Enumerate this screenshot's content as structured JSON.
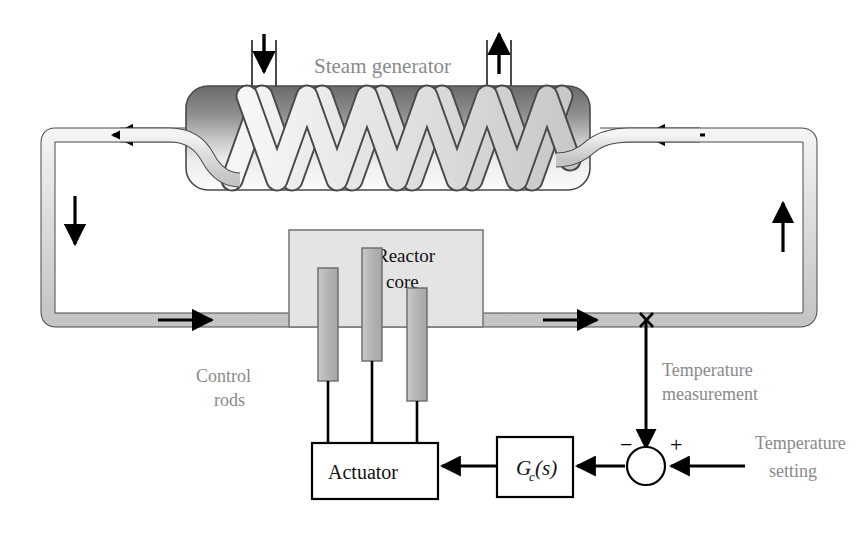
{
  "diagram": {
    "labels": {
      "steam_generator": "Steam generator",
      "reactor_core_line1": "Reactor",
      "reactor_core_line2": "core",
      "control_rods_line1": "Control",
      "control_rods_line2": "rods",
      "temperature_measurement_line1": "Temperature",
      "temperature_measurement_line2": "measurement",
      "temperature_setting_line1": "Temperature",
      "temperature_setting_line2": "setting",
      "actuator": "Actuator",
      "controller_g": "G",
      "controller_sub": "c",
      "controller_arg": "(s)",
      "sign_negative": "−",
      "sign_positive": "+"
    },
    "colors": {
      "label_gray": "#8a8a8a",
      "text_black": "#111111",
      "pipe_fill": "#d6d6d6",
      "pipe_stroke": "#4a4a4a",
      "vessel_dark": "#6e6e6e",
      "vessel_light": "#f2f2f2",
      "coil_fill": "#dcdcdc",
      "core_fill": "#e4e4e4",
      "core_stroke": "#7a7a7a",
      "rod_fill": "#b8b8b8",
      "rod_stroke": "#6a6a6a",
      "box_fill": "#ffffff",
      "box_stroke": "#000000",
      "arrow": "#000000",
      "background": "#ffffff"
    },
    "geometry": {
      "canvas_width": 858,
      "canvas_height": 540,
      "coil_peaks": 8,
      "control_rod_count": 3,
      "flow_arrow_count": 4
    },
    "flow_arrows": [
      {
        "name": "top-left-flow-arrow",
        "direction": "left"
      },
      {
        "name": "top-right-flow-arrow",
        "direction": "left"
      },
      {
        "name": "left-down-flow-arrow",
        "direction": "down"
      },
      {
        "name": "right-up-flow-arrow",
        "direction": "up"
      },
      {
        "name": "bottom-left-flow-arrow",
        "direction": "right"
      },
      {
        "name": "bottom-right-flow-arrow",
        "direction": "right"
      }
    ],
    "steam_ports": [
      {
        "name": "feedwater-inlet-arrow",
        "direction": "down"
      },
      {
        "name": "steam-outlet-arrow",
        "direction": "up"
      }
    ]
  }
}
